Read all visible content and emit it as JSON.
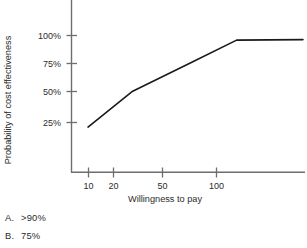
{
  "chart_data": {
    "type": "line",
    "title": "",
    "subtitle": "",
    "xlabel": "Willingness to pay",
    "ylabel": "Probability of cost effectiveness",
    "x_scale": "log",
    "x_ticks": [
      "10",
      "20",
      "50",
      "100"
    ],
    "x_tick_values": [
      10,
      20,
      50,
      100
    ],
    "y_ticks": [
      "25%",
      "50%",
      "75%",
      "100%"
    ],
    "y_tick_values": [
      25,
      50,
      75,
      100
    ],
    "ylim": [
      0,
      110
    ],
    "xlim": [
      8,
      300
    ],
    "grid": false,
    "legend": "none",
    "series": [
      {
        "name": "Probability of cost effectiveness",
        "x": [
          10,
          20,
          50,
          100,
          280
        ],
        "values": [
          21,
          52,
          77,
          96,
          96.5
        ],
        "color": "#1a1a1a"
      }
    ],
    "annotations": []
  },
  "figure": {
    "axis_color": "#6e6e6e",
    "line_color": "#1a1a1a",
    "background": "#ffffff",
    "y_axis_label": "Probability of cost effectiveness",
    "x_axis_label": "Willingness to pay",
    "x_tick_labels": [
      "10",
      "20",
      "50",
      "100"
    ],
    "y_tick_labels": [
      "100%",
      "75%",
      "50%",
      "25%"
    ]
  },
  "answers": {
    "options": [
      {
        "key": "A.",
        "text": ">90%"
      },
      {
        "key": "B.",
        "text": "75%"
      }
    ]
  }
}
